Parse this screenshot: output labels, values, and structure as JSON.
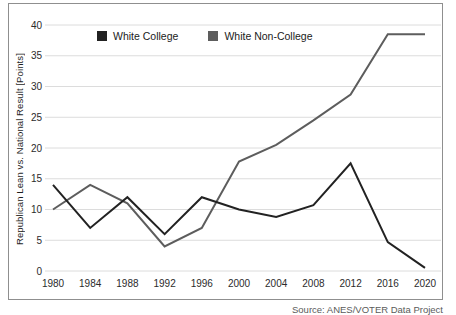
{
  "figure": {
    "caption": "Source: ANES/VOTER Data Project"
  },
  "chart_data": {
    "type": "line",
    "title": "",
    "xlabel": "",
    "ylabel": "Republican Lean vs. National Result [Points]",
    "x": [
      1980,
      1984,
      1988,
      1992,
      1996,
      2000,
      2004,
      2008,
      2012,
      2016,
      2020
    ],
    "series": [
      {
        "name": "White College",
        "color": "#222222",
        "values": [
          14,
          7,
          12,
          6,
          12,
          10,
          8.8,
          10.7,
          17.5,
          4.7,
          0.5
        ]
      },
      {
        "name": "White Non-College",
        "color": "#5d5d5d",
        "values": [
          10,
          14,
          11,
          4,
          7,
          17.8,
          20.5,
          24.5,
          28.7,
          38.5,
          38.5
        ]
      }
    ],
    "ylim": [
      0,
      40
    ],
    "yticks": [
      0,
      5,
      10,
      15,
      20,
      25,
      30,
      35,
      40
    ],
    "grid": "horizontal",
    "gridline_color": "#dcdcdc",
    "tick_color": "#2b2b2b",
    "legend_position": "top-inside"
  }
}
